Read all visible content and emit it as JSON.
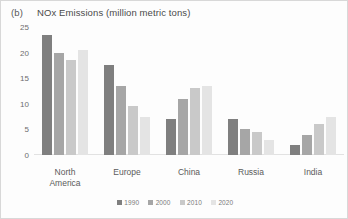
{
  "panel": {
    "letter": "(b)",
    "title": "NOx Emissions (million metric tons)"
  },
  "chart_data": {
    "type": "bar",
    "title": "NOx Emissions (million metric tons)",
    "xlabel": "",
    "ylabel": "",
    "ylim": [
      0,
      25
    ],
    "yticks": [
      0,
      5,
      10,
      15,
      20,
      25
    ],
    "grid": false,
    "legend_position": "bottom",
    "categories": [
      "North America",
      "Europe",
      "China",
      "Russia",
      "India"
    ],
    "series": [
      {
        "name": "1990",
        "color": "#7f7f7f",
        "values": [
          23.5,
          17.5,
          7.0,
          7.0,
          2.0
        ]
      },
      {
        "name": "2000",
        "color": "#a6a6a6",
        "values": [
          20.0,
          13.5,
          11.0,
          5.0,
          4.0
        ]
      },
      {
        "name": "2010",
        "color": "#c9c9c9",
        "values": [
          18.5,
          9.5,
          13.0,
          4.5,
          6.0
        ]
      },
      {
        "name": "2020",
        "color": "#e4e4e4",
        "values": [
          20.5,
          7.5,
          13.5,
          3.0,
          7.5
        ]
      }
    ]
  },
  "axis": {
    "y_tick_labels": [
      "25",
      "20",
      "15",
      "10",
      "5",
      "0"
    ],
    "x_tick_labels": [
      {
        "line1": "North",
        "line2": "America"
      },
      {
        "line1": "Europe",
        "line2": ""
      },
      {
        "line1": "China",
        "line2": ""
      },
      {
        "line1": "Russia",
        "line2": ""
      },
      {
        "line1": "India",
        "line2": ""
      }
    ]
  },
  "legend": {
    "items": [
      {
        "label": "1990",
        "color": "#7f7f7f"
      },
      {
        "label": "2000",
        "color": "#a6a6a6"
      },
      {
        "label": "2010",
        "color": "#c9c9c9"
      },
      {
        "label": "2020",
        "color": "#e4e4e4"
      }
    ]
  }
}
